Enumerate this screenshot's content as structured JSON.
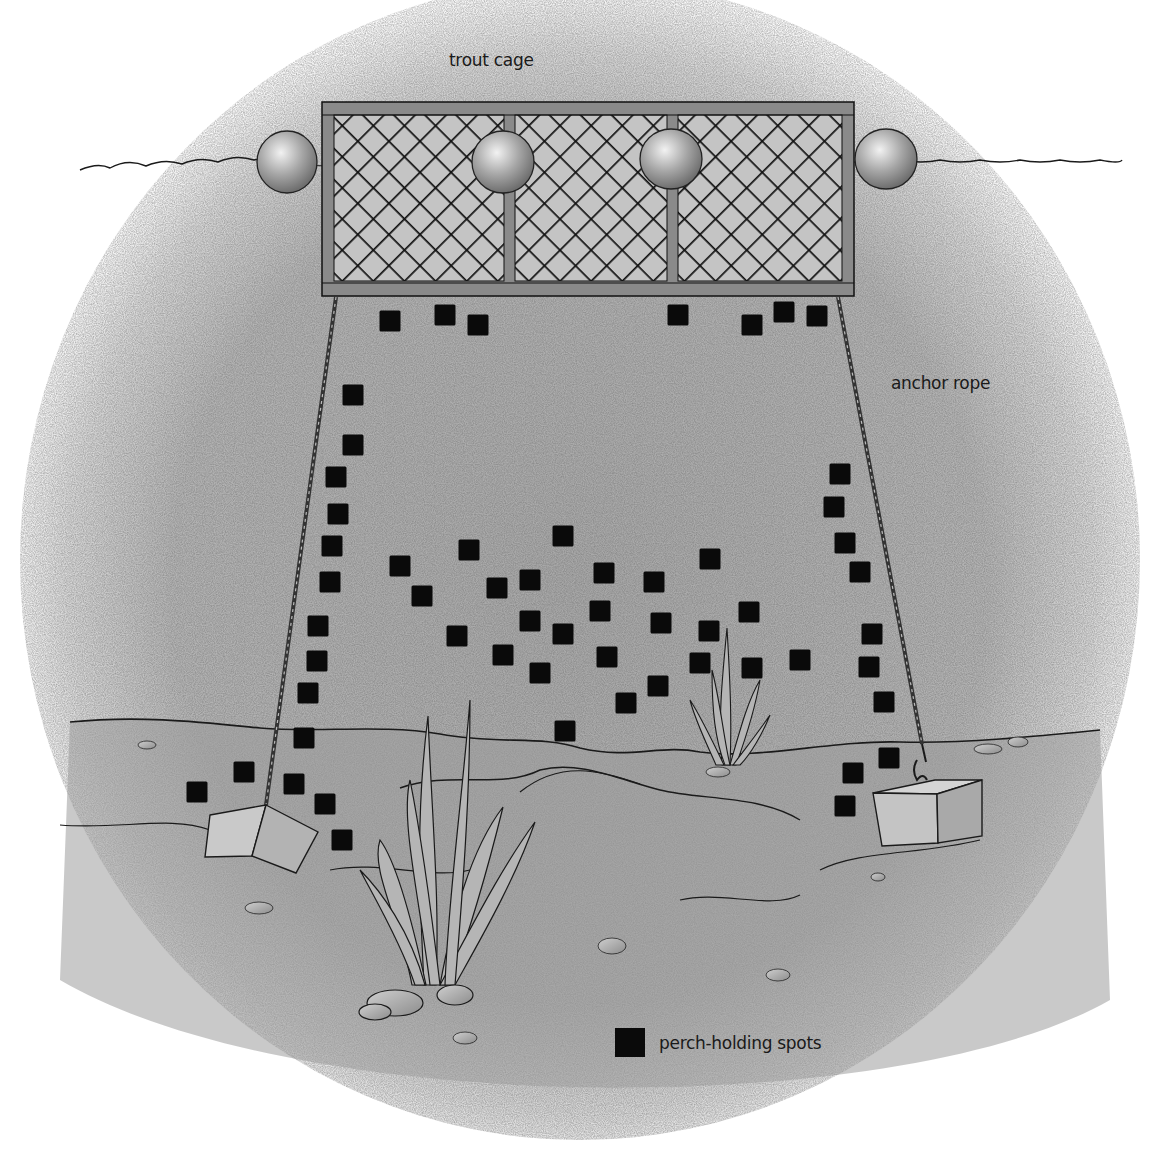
{
  "labels": {
    "cage": "trout cage",
    "rope": "anchor rope",
    "legend": "perch-holding spots"
  },
  "colors": {
    "marker": "#0a0a0a",
    "water": "#b9b9b9",
    "frame": "#8a8a8a",
    "line": "#1a1a1a"
  },
  "marker_size": 21,
  "markers": [
    [
      390,
      321
    ],
    [
      445,
      315
    ],
    [
      478,
      325
    ],
    [
      678,
      315
    ],
    [
      752,
      325
    ],
    [
      784,
      312
    ],
    [
      817,
      316
    ],
    [
      353,
      395
    ],
    [
      353,
      445
    ],
    [
      336,
      477
    ],
    [
      338,
      514
    ],
    [
      332,
      546
    ],
    [
      330,
      582
    ],
    [
      400,
      566
    ],
    [
      422,
      596
    ],
    [
      469,
      550
    ],
    [
      497,
      588
    ],
    [
      530,
      580
    ],
    [
      563,
      536
    ],
    [
      457,
      636
    ],
    [
      503,
      655
    ],
    [
      530,
      621
    ],
    [
      563,
      634
    ],
    [
      540,
      673
    ],
    [
      604,
      573
    ],
    [
      600,
      611
    ],
    [
      607,
      657
    ],
    [
      654,
      582
    ],
    [
      661,
      623
    ],
    [
      626,
      703
    ],
    [
      658,
      686
    ],
    [
      710,
      559
    ],
    [
      709,
      631
    ],
    [
      700,
      663
    ],
    [
      749,
      612
    ],
    [
      752,
      668
    ],
    [
      800,
      660
    ],
    [
      565,
      731
    ],
    [
      318,
      626
    ],
    [
      317,
      661
    ],
    [
      308,
      693
    ],
    [
      304,
      738
    ],
    [
      244,
      772
    ],
    [
      197,
      792
    ],
    [
      294,
      784
    ],
    [
      325,
      804
    ],
    [
      342,
      840
    ],
    [
      840,
      474
    ],
    [
      834,
      507
    ],
    [
      845,
      543
    ],
    [
      860,
      572
    ],
    [
      872,
      634
    ],
    [
      869,
      667
    ],
    [
      884,
      702
    ],
    [
      889,
      758
    ],
    [
      853,
      773
    ],
    [
      845,
      806
    ]
  ]
}
